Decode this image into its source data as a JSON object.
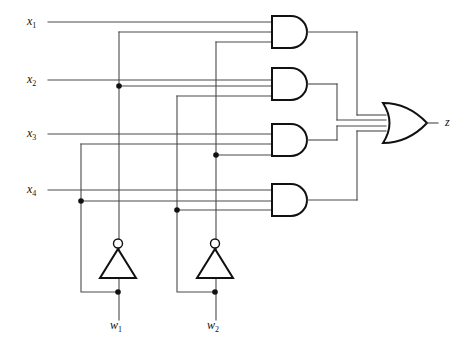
{
  "diagram": {
    "type": "logic-circuit",
    "canvas": {
      "width": 475,
      "height": 349,
      "background": "#ffffff"
    },
    "colors": {
      "wire": "#4a4a4a",
      "gate_outline": "#111111",
      "label": "#111111",
      "fill": "#ffffff"
    },
    "inputs": [
      {
        "id": "x1",
        "base": "x",
        "sub": "1",
        "x": 30,
        "y": 22,
        "line_y": 22
      },
      {
        "id": "x2",
        "base": "x",
        "sub": "2",
        "x": 30,
        "y": 80,
        "line_y": 80
      },
      {
        "id": "x3",
        "base": "x",
        "sub": "3",
        "x": 30,
        "y": 134,
        "line_y": 134
      },
      {
        "id": "x4",
        "base": "x",
        "sub": "4",
        "x": 30,
        "y": 190,
        "line_y": 190
      }
    ],
    "selects": [
      {
        "id": "w1",
        "base": "w",
        "sub": "1",
        "x": 112,
        "y": 330
      },
      {
        "id": "w2",
        "base": "w",
        "sub": "2",
        "x": 209,
        "y": 330
      }
    ],
    "output": {
      "id": "z",
      "base": "z",
      "sub": "",
      "x": 445,
      "y": 122
    },
    "and_gates": [
      {
        "id": "and1",
        "inputs": 3,
        "x": 272,
        "y": 16,
        "w": 38,
        "h": 32
      },
      {
        "id": "and2",
        "inputs": 3,
        "x": 272,
        "y": 68,
        "w": 38,
        "h": 32
      },
      {
        "id": "and3",
        "inputs": 3,
        "x": 272,
        "y": 124,
        "w": 38,
        "h": 32
      },
      {
        "id": "and4",
        "inputs": 3,
        "x": 272,
        "y": 184,
        "w": 38,
        "h": 32
      }
    ],
    "or_gate": {
      "id": "or1",
      "inputs": 4,
      "x": 383,
      "y": 103,
      "w": 44,
      "h": 40
    },
    "inverters": [
      {
        "id": "inv1",
        "cx": 118,
        "top": 248,
        "bottom": 278,
        "half_width": 18,
        "bubble_cy": 243,
        "bubble_r": 4.5
      },
      {
        "id": "inv2",
        "cx": 215,
        "top": 248,
        "bottom": 278,
        "half_width": 18,
        "bubble_cy": 243,
        "bubble_r": 4.5
      }
    ],
    "junction_dots": [
      {
        "x": 119,
        "y": 86
      },
      {
        "x": 216,
        "y": 155
      },
      {
        "x": 81,
        "y": 201
      },
      {
        "x": 177,
        "y": 210
      },
      {
        "x": 118,
        "y": 292
      },
      {
        "x": 215,
        "y": 292
      }
    ]
  }
}
